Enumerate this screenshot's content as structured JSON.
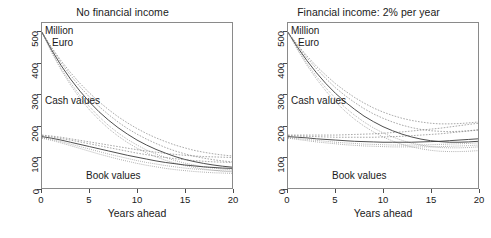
{
  "figure": {
    "width": 491,
    "height": 238,
    "background": "#ffffff",
    "axis_color": "#4d4d4d",
    "curve_color": "#555555"
  },
  "panels": [
    {
      "id": "no-financial-income",
      "title": "No financial income",
      "units_line1": "Million",
      "units_line2": "Euro",
      "cash_label": "Cash values",
      "book_label": "Book values",
      "xlabel": "Years ahead"
    },
    {
      "id": "financial-income-2pct",
      "title": "Financial income: 2% per year",
      "units_line1": "Million",
      "units_line2": "Euro",
      "cash_label": "Cash values",
      "book_label": "Book values",
      "xlabel": "Years ahead"
    }
  ],
  "axes": {
    "yticks": [
      0,
      100,
      200,
      300,
      400,
      500
    ],
    "ytick_labels": [
      "0",
      "100",
      "200",
      "300",
      "400",
      "500"
    ],
    "xticks": [
      0,
      5,
      10,
      15,
      20
    ],
    "xtick_labels": [
      "0",
      "5",
      "10",
      "15",
      "20"
    ],
    "xlim": [
      0,
      20
    ],
    "ylim": [
      0,
      530
    ],
    "grid": false
  },
  "chart_data": {
    "type": "line",
    "xlabel": "Years ahead",
    "ylabel": "Million Euro",
    "xlim": [
      0,
      20
    ],
    "ylim": [
      0,
      530
    ],
    "grid": false,
    "legend_position": "in-plot annotations",
    "x": [
      0,
      1,
      2,
      3,
      4,
      5,
      6,
      7,
      8,
      9,
      10,
      11,
      12,
      13,
      14,
      15,
      16,
      17,
      18,
      19,
      20
    ],
    "panels": [
      {
        "name": "No financial income",
        "annotations": [
          "Million Euro",
          "Cash values",
          "Book values"
        ],
        "groups": [
          {
            "group": "Cash values",
            "series": [
              {
                "name": "cash-central",
                "values": [
                  500,
                  444,
                  394,
                  350,
                  311,
                  276,
                  245,
                  218,
                  194,
                  173,
                  154,
                  138,
                  124,
                  112,
                  101,
                  92,
                  85,
                  79,
                  74,
                  70,
                  67
                ]
              },
              {
                "name": "cash-upper",
                "values": [
                  500,
                  449,
                  403,
                  362,
                  325,
                  292,
                  262,
                  236,
                  212,
                  191,
                  173,
                  157,
                  143,
                  130,
                  119,
                  110,
                  102,
                  96,
                  91,
                  87,
                  84
                ]
              },
              {
                "name": "cash-lower",
                "values": [
                  500,
                  439,
                  385,
                  338,
                  297,
                  261,
                  229,
                  201,
                  177,
                  156,
                  138,
                  122,
                  109,
                  98,
                  88,
                  80,
                  74,
                  68,
                  64,
                  61,
                  58
                ]
              },
              {
                "name": "cash-band-hi",
                "values": [
                  500,
                  452,
                  409,
                  371,
                  336,
                  305,
                  277,
                  252,
                  229,
                  209,
                  191,
                  175,
                  161,
                  149,
                  138,
                  129,
                  121,
                  115,
                  110,
                  106,
                  103
                ]
              },
              {
                "name": "cash-band-lo",
                "values": [
                  500,
                  436,
                  380,
                  331,
                  288,
                  251,
                  219,
                  191,
                  167,
                  146,
                  128,
                  113,
                  100,
                  89,
                  80,
                  72,
                  66,
                  61,
                  57,
                  54,
                  52
                ]
              }
            ]
          },
          {
            "group": "Book values",
            "series": [
              {
                "name": "book-central",
                "values": [
                  165,
                  160,
                  154,
                  147,
                  140,
                  133,
                  126,
                  119,
                  112,
                  105,
                  99,
                  93,
                  87,
                  82,
                  78,
                  74,
                  71,
                  68,
                  66,
                  64,
                  63
                ]
              },
              {
                "name": "book-upper",
                "values": [
                  168,
                  164,
                  159,
                  154,
                  148,
                  142,
                  136,
                  130,
                  124,
                  118,
                  112,
                  107,
                  102,
                  98,
                  94,
                  91,
                  88,
                  86,
                  84,
                  83,
                  82
                ]
              },
              {
                "name": "book-lower",
                "values": [
                  162,
                  156,
                  149,
                  141,
                  133,
                  125,
                  117,
                  109,
                  102,
                  95,
                  88,
                  82,
                  77,
                  72,
                  68,
                  64,
                  61,
                  59,
                  57,
                  55,
                  54
                ]
              },
              {
                "name": "book-band-hi",
                "values": [
                  170,
                  167,
                  163,
                  158,
                  153,
                  148,
                  143,
                  138,
                  133,
                  128,
                  123,
                  119,
                  115,
                  111,
                  108,
                  105,
                  103,
                  101,
                  100,
                  99,
                  98
                ]
              },
              {
                "name": "book-band-lo",
                "values": [
                  160,
                  153,
                  145,
                  136,
                  127,
                  118,
                  109,
                  101,
                  93,
                  86,
                  79,
                  73,
                  68,
                  63,
                  59,
                  56,
                  53,
                  51,
                  49,
                  48,
                  47
                ]
              }
            ]
          }
        ]
      },
      {
        "name": "Financial income: 2% per year",
        "annotations": [
          "Million Euro",
          "Cash values",
          "Book values"
        ],
        "groups": [
          {
            "group": "Cash values",
            "series": [
              {
                "name": "cash-central",
                "values": [
                  500,
                  452,
                  409,
                  370,
                  335,
                  304,
                  277,
                  253,
                  231,
                  213,
                  197,
                  184,
                  173,
                  164,
                  157,
                  152,
                  149,
                  147,
                  147,
                  148,
                  150
                ]
              },
              {
                "name": "cash-upper",
                "values": [
                  500,
                  457,
                  418,
                  383,
                  351,
                  322,
                  297,
                  275,
                  255,
                  238,
                  224,
                  212,
                  202,
                  194,
                  188,
                  184,
                  182,
                  181,
                  182,
                  184,
                  187
                ]
              },
              {
                "name": "cash-lower",
                "values": [
                  500,
                  447,
                  400,
                  358,
                  321,
                  288,
                  259,
                  234,
                  212,
                  193,
                  177,
                  164,
                  153,
                  144,
                  138,
                  133,
                  130,
                  129,
                  129,
                  130,
                  132
                ]
              },
              {
                "name": "cash-band-hi",
                "values": [
                  500,
                  460,
                  424,
                  391,
                  362,
                  335,
                  312,
                  291,
                  273,
                  257,
                  244,
                  233,
                  224,
                  217,
                  212,
                  208,
                  206,
                  206,
                  207,
                  209,
                  212
                ]
              },
              {
                "name": "cash-band-lo",
                "values": [
                  500,
                  444,
                  394,
                  350,
                  311,
                  277,
                  247,
                  221,
                  199,
                  180,
                  164,
                  151,
                  140,
                  132,
                  126,
                  121,
                  118,
                  117,
                  117,
                  118,
                  120
                ]
              }
            ]
          },
          {
            "group": "Book values",
            "series": [
              {
                "name": "book-central",
                "values": [
                  165,
                  163,
                  161,
                  158,
                  156,
                  154,
                  152,
                  150,
                  149,
                  148,
                  147,
                  147,
                  147,
                  147,
                  148,
                  149,
                  150,
                  152,
                  154,
                  156,
                  158
                ]
              },
              {
                "name": "book-upper",
                "values": [
                  168,
                  167,
                  166,
                  165,
                  164,
                  163,
                  163,
                  163,
                  163,
                  163,
                  164,
                  165,
                  166,
                  168,
                  170,
                  172,
                  174,
                  177,
                  180,
                  183,
                  186
                ]
              },
              {
                "name": "book-lower",
                "values": [
                  162,
                  159,
                  156,
                  153,
                  150,
                  147,
                  145,
                  143,
                  141,
                  140,
                  139,
                  138,
                  138,
                  138,
                  138,
                  139,
                  140,
                  141,
                  142,
                  143,
                  145
                ]
              },
              {
                "name": "book-band-hi",
                "values": [
                  170,
                  170,
                  170,
                  170,
                  170,
                  170,
                  171,
                  172,
                  173,
                  174,
                  176,
                  178,
                  180,
                  183,
                  186,
                  189,
                  192,
                  196,
                  200,
                  204,
                  208
                ]
              },
              {
                "name": "book-band-lo",
                "values": [
                  160,
                  156,
                  152,
                  148,
                  145,
                  142,
                  139,
                  137,
                  135,
                  134,
                  133,
                  132,
                  132,
                  132,
                  132,
                  132,
                  133,
                  134,
                  135,
                  136,
                  138
                ]
              }
            ]
          }
        ]
      }
    ]
  }
}
